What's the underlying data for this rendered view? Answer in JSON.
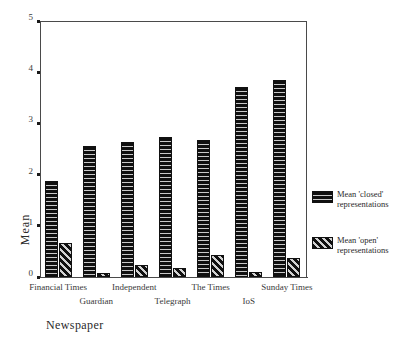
{
  "chart_data": {
    "type": "bar",
    "title": "",
    "xlabel": "Newspaper",
    "ylabel": "Mean",
    "ylim": [
      0,
      5
    ],
    "yticks": [
      "0",
      "1",
      "2",
      "3",
      "4",
      "5"
    ],
    "grid": false,
    "legend_position": "right",
    "categories": [
      "Financial Times",
      "Guardian",
      "Independent",
      "Telegraph",
      "The Times",
      "IoS",
      "Sunday Times"
    ],
    "series": [
      {
        "name": "Mean 'closed' representations",
        "name_line1": "Mean 'closed'",
        "name_line2": "representations",
        "pattern": "horizontal-stripes",
        "color": "#151515",
        "values": [
          1.88,
          2.56,
          2.63,
          2.73,
          2.68,
          3.72,
          3.85
        ]
      },
      {
        "name": "Mean 'open' representations",
        "name_line1": "Mean 'open'",
        "name_line2": "representations",
        "pattern": "diagonal-stripes",
        "color": "#151515",
        "values": [
          0.67,
          0.08,
          0.23,
          0.17,
          0.43,
          0.09,
          0.38
        ]
      }
    ]
  },
  "axes": {
    "y_title": "Mean",
    "x_title": "Newspaper"
  },
  "legend": {
    "items": [
      {
        "line1": "Mean 'closed'",
        "line2": "representations",
        "swatch": "horizontal-stripe-swatch"
      },
      {
        "line1": "Mean 'open'",
        "line2": "representations",
        "swatch": "diagonal-stripe-swatch"
      }
    ]
  }
}
